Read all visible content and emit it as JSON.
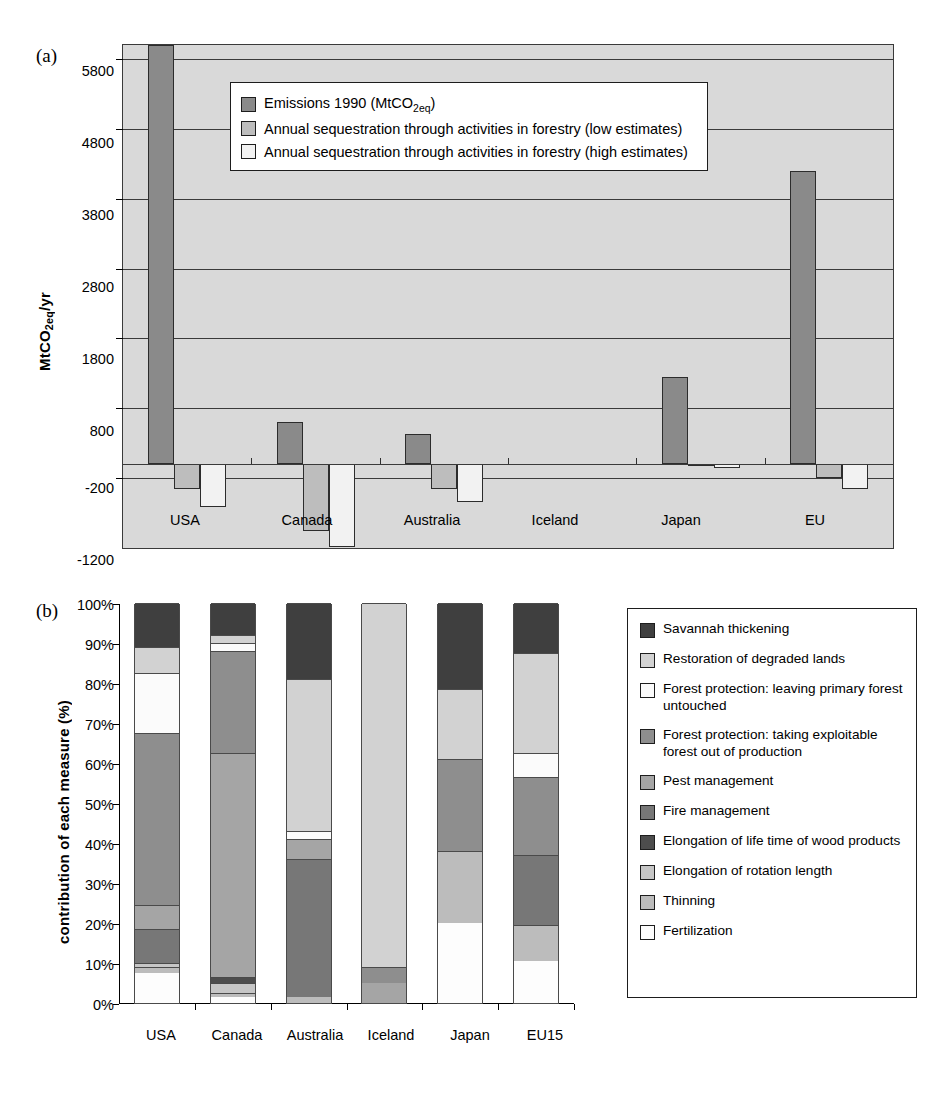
{
  "figure": {
    "panel_a_letter": "(a)",
    "panel_b_letter": "(b)"
  },
  "chart_a": {
    "ylabel_main": "MtCO",
    "ylabel_sub": "2eq",
    "ylabel_tail": "/yr",
    "yticks": [
      "5800",
      "4800",
      "3800",
      "2800",
      "1800",
      "800",
      "-200",
      "-1200"
    ],
    "categories": [
      "USA",
      "Canada",
      "Australia",
      "Iceland",
      "Japan",
      "EU"
    ],
    "legend": [
      {
        "label": "Emissions 1990 (MtCO2eq)",
        "label_pre": "Emissions 1990 (MtCO",
        "label_sub": "2eq",
        "label_post": ")",
        "color": "#8a8a8a"
      },
      {
        "label": "Annual sequestration through activities in forestry (low estimates)",
        "color": "#bdbdbd"
      },
      {
        "label": "Annual sequestration through activities in forestry (high estimates)",
        "color": "#f2f2f2"
      }
    ]
  },
  "chart_b": {
    "ylabel": "contribution of each measure (%)",
    "yticks": [
      "100%",
      "90%",
      "80%",
      "70%",
      "60%",
      "50%",
      "40%",
      "30%",
      "20%",
      "10%",
      "0%"
    ],
    "categories": [
      "USA",
      "Canada",
      "Australia",
      "Iceland",
      "Japan",
      "EU15"
    ],
    "legend": [
      {
        "label": "Savannah thickening",
        "color": "#3f3f3f"
      },
      {
        "label": "Restoration of degraded lands",
        "color": "#d2d2d2"
      },
      {
        "label": "Forest protection: leaving primary forest untouched",
        "color": "#fbfbfb"
      },
      {
        "label": "Forest protection: taking exploitable forest out of production",
        "color": "#8e8e8e"
      },
      {
        "label": "Pest management",
        "color": "#a5a5a5"
      },
      {
        "label": "Fire management",
        "color": "#777777"
      },
      {
        "label": "Elongation of life time of wood products",
        "color": "#4d4d4d"
      },
      {
        "label": "Elongation of rotation length",
        "color": "#c6c6c6"
      },
      {
        "label": "Thinning",
        "color": "#bcbcbc"
      },
      {
        "label": "Fertilization",
        "color": "#fdfdfd"
      }
    ]
  },
  "chart_data": [
    {
      "type": "bar",
      "id": "panel-a",
      "title": "",
      "xlabel": "",
      "ylabel": "MtCO2eq/yr",
      "ylim": [
        -1200,
        6000
      ],
      "yticks": [
        -1200,
        -200,
        800,
        1800,
        2800,
        3800,
        4800,
        5800
      ],
      "grid": true,
      "legend_position": "inside-top-center",
      "categories": [
        "USA",
        "Canada",
        "Australia",
        "Iceland",
        "Japan",
        "EU"
      ],
      "series": [
        {
          "name": "Emissions 1990 (MtCO2eq)",
          "color": "#8a8a8a",
          "values": [
            6000,
            600,
            425,
            0,
            1250,
            4200
          ]
        },
        {
          "name": "Annual sequestration through activities in forestry (low estimates)",
          "color": "#bdbdbd",
          "values": [
            -355,
            -950,
            -355,
            0,
            -25,
            -205
          ]
        },
        {
          "name": "Annual sequestration through activities in forestry (high estimates)",
          "color": "#f2f2f2",
          "values": [
            -610,
            -1180,
            -540,
            0,
            -60,
            -350
          ]
        }
      ]
    },
    {
      "type": "bar",
      "id": "panel-b",
      "subtype": "stacked-100",
      "title": "",
      "xlabel": "",
      "ylabel": "contribution of each measure (%)",
      "ylim": [
        0,
        100
      ],
      "yticks": [
        0,
        10,
        20,
        30,
        40,
        50,
        60,
        70,
        80,
        90,
        100
      ],
      "grid": false,
      "legend_position": "right",
      "categories": [
        "USA",
        "Canada",
        "Australia",
        "Iceland",
        "Japan",
        "EU15"
      ],
      "series": [
        {
          "name": "Fertilization",
          "color": "#fdfdfd",
          "values": [
            7.5,
            1.5,
            0,
            0,
            20,
            10.5
          ]
        },
        {
          "name": "Thinning",
          "color": "#bcbcbc",
          "values": [
            1.5,
            1.0,
            1.5,
            0,
            18,
            9.0
          ]
        },
        {
          "name": "Elongation of rotation length",
          "color": "#c6c6c6",
          "values": [
            1.0,
            2.5,
            0,
            0,
            0,
            0
          ]
        },
        {
          "name": "Elongation of life time of wood products",
          "color": "#4d4d4d",
          "values": [
            0,
            1.5,
            0,
            0,
            0,
            0
          ]
        },
        {
          "name": "Fire management",
          "color": "#777777",
          "values": [
            8.5,
            0,
            34.5,
            0,
            0,
            17.5
          ]
        },
        {
          "name": "Pest management",
          "color": "#a5a5a5",
          "values": [
            6.0,
            56.0,
            5.0,
            5.0,
            0,
            0
          ]
        },
        {
          "name": "Forest protection: taking exploitable forest out of production",
          "color": "#8e8e8e",
          "values": [
            43.0,
            25.5,
            0,
            4.0,
            23.0,
            19.5
          ]
        },
        {
          "name": "Forest protection: leaving primary forest untouched",
          "color": "#fbfbfb",
          "values": [
            15.0,
            2.0,
            2.0,
            0,
            0,
            6.0
          ]
        },
        {
          "name": "Restoration of degraded lands",
          "color": "#d2d2d2",
          "values": [
            6.5,
            2.0,
            38.0,
            91.0,
            17.5,
            25.0
          ]
        },
        {
          "name": "Savannah thickening",
          "color": "#3f3f3f",
          "values": [
            11.0,
            8.0,
            19.0,
            0,
            21.5,
            12.5
          ]
        }
      ]
    }
  ]
}
